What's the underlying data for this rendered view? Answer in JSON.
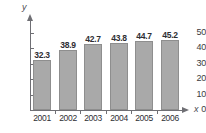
{
  "top_caption": "",
  "axis": {
    "y_label": "y",
    "x_label": "x"
  },
  "chart_data": {
    "type": "bar",
    "title": "",
    "xlabel": "x",
    "ylabel": "y",
    "categories": [
      "2001",
      "2002",
      "2003",
      "2004",
      "2005",
      "2006"
    ],
    "values": [
      32.3,
      38.9,
      42.7,
      43.8,
      44.7,
      45.2
    ],
    "value_labels": [
      "32.3",
      "38.9",
      "42.7",
      "43.8",
      "44.7",
      "45.2"
    ],
    "ylim": [
      0,
      55
    ],
    "y_ticks": [
      0,
      10,
      20,
      30,
      40,
      50
    ],
    "y_tick_labels": [
      "0",
      "10",
      "20",
      "30",
      "40",
      "50"
    ],
    "grid": false,
    "legend": null,
    "bar_color": "#a9a9a9",
    "bar_border_color": "#8e8e8e",
    "axis_color": "#6f6f74",
    "text_color": "#2e2e33",
    "background": "#ffffff"
  }
}
